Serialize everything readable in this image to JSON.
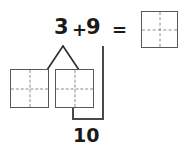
{
  "figure": {
    "type": "make-ten number bond worksheet",
    "equation": {
      "addend_a": "3",
      "operator_plus": "+",
      "addend_b": "9",
      "operator_equals": "=",
      "answer": ""
    },
    "answer_box": {
      "name": "answer-cell",
      "value": "",
      "grid": "quartered dashed"
    },
    "decomposition": {
      "bond_apex_label": "",
      "parts": [
        {
          "name": "part-cell-left",
          "value": ""
        },
        {
          "name": "part-cell-right",
          "value": ""
        }
      ]
    },
    "bracket": {
      "label": "10"
    },
    "colors": {
      "ink": "#1a1a1a",
      "cell_border": "#575757",
      "dash": "#8a8a8a",
      "bracket": "#4a4a4a",
      "background": "#ffffff"
    }
  }
}
